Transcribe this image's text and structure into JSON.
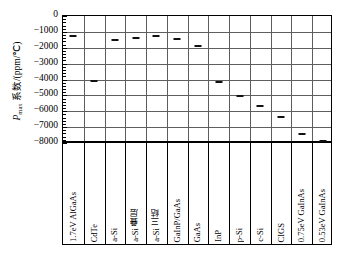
{
  "chart_data": {
    "type": "bar",
    "subtype": "error-bar-range",
    "title": "",
    "xlabel": "",
    "ylabel": "Pmax 系数/(ppm/℃)",
    "ylabel_parts": {
      "italic": "P",
      "subscript": "max",
      "rest": " 系数/(ppm/℃)"
    },
    "ylim": [
      0,
      -8000
    ],
    "y_inverted": true,
    "y_ticks": [
      -8000,
      -7000,
      -6000,
      -5000,
      -4000,
      -3000,
      -2000,
      -1000,
      0
    ],
    "y_tick_labels": [
      "-8000",
      "-7000",
      "-6000",
      "-5000",
      "-4000",
      "-3000",
      "-2000",
      "-1000",
      "0"
    ],
    "y_minor_tick_step": 200,
    "grid": "both",
    "legend": "none",
    "categories": [
      "1.7eV AlGaAs",
      "CdTe",
      "a-Si",
      "a-Si 叠层",
      "a-Si 三结",
      "GaInP/GaAs",
      "GaAs",
      "InP",
      "p-Si",
      "c-Si",
      "CIGS",
      "0.75eV GaInAs",
      "0.53eV GaInAs"
    ],
    "series": [
      {
        "name": "Pmax 温度系数范围",
        "low": [
          -550,
          -700,
          -450,
          -500,
          -600,
          -1150,
          -1300,
          -3900,
          -3000,
          -2600,
          -1700,
          -3950,
          -5200
        ],
        "high": [
          -1200,
          -4050,
          -1450,
          -1350,
          -1200,
          -1400,
          -1800,
          -4100,
          -5000,
          -5600,
          -6300,
          -7400,
          -7800
        ]
      }
    ],
    "colors": {
      "frame": "#000000",
      "grid": "#5e5e5e",
      "bar": "#111111",
      "background": "#ffffff"
    }
  }
}
